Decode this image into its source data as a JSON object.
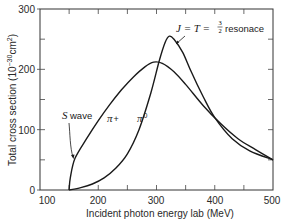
{
  "chart_data": {
    "type": "line",
    "title": "",
    "xlabel": "Incident photon energy lab (MeV)",
    "ylabel": "Total cross section (10^-30 cm^2)",
    "ylabel_main": "Total cross section (10",
    "ylabel_exp": "−30",
    "ylabel_unit": "cm",
    "ylabel_unit_exp": "2",
    "ylabel_close": ")",
    "xlim": [
      100,
      500
    ],
    "ylim": [
      0,
      300
    ],
    "x_ticks": [
      100,
      200,
      300,
      400,
      500
    ],
    "x_minor_ticks": [
      150,
      250,
      350,
      450
    ],
    "y_ticks": [
      0,
      100,
      200,
      300
    ],
    "y_minor_ticks": [
      50,
      150,
      250
    ],
    "grid": false,
    "legend": null,
    "series": [
      {
        "name": "π+",
        "x": [
          150,
          152,
          160,
          180,
          200,
          220,
          240,
          260,
          280,
          295,
          310,
          330,
          350,
          380,
          410,
          440,
          470,
          500
        ],
        "y": [
          0,
          20,
          52,
          85,
          115,
          142,
          166,
          187,
          204,
          212,
          210,
          196,
          175,
          140,
          110,
          85,
          67,
          50
        ]
      },
      {
        "name": "π0",
        "x": [
          150,
          170,
          190,
          210,
          230,
          250,
          270,
          290,
          305,
          315,
          322,
          330,
          345,
          360,
          380,
          400,
          430,
          460,
          500
        ],
        "y": [
          0,
          4,
          10,
          20,
          36,
          60,
          100,
          160,
          215,
          245,
          255,
          250,
          228,
          195,
          155,
          120,
          85,
          65,
          50
        ]
      }
    ],
    "annotations": [
      {
        "text": "J = T = 3/2 resonace",
        "points_to": [
          325,
          248
        ]
      },
      {
        "text": "S wave",
        "points_to": [
          152,
          55
        ]
      },
      {
        "text": "π+",
        "near": [
          215,
          110
        ]
      },
      {
        "text": "π0",
        "near": [
          283,
          110
        ]
      }
    ]
  },
  "labels": {
    "xlabel": "Incident photon energy lab (MeV)",
    "ylabel_main": "Total cross section (10",
    "ylabel_exp": "−30",
    "ylabel_unit": "cm",
    "ylabel_unit_exp": "2",
    "ylabel_close": ")",
    "x_ticks": [
      "100",
      "200",
      "300",
      "400",
      "500"
    ],
    "y_ticks": [
      "0",
      "100",
      "200",
      "300"
    ],
    "resonance_lhs": "J = T = ",
    "resonance_num": "3",
    "resonance_den": "2",
    "resonance_word": "resonace",
    "s_letter": "S",
    "s_word": "wave",
    "pi_plus_symbol": "π",
    "pi_plus_sign": "+",
    "pi_zero_symbol": "π",
    "pi_zero_sup": "0"
  }
}
